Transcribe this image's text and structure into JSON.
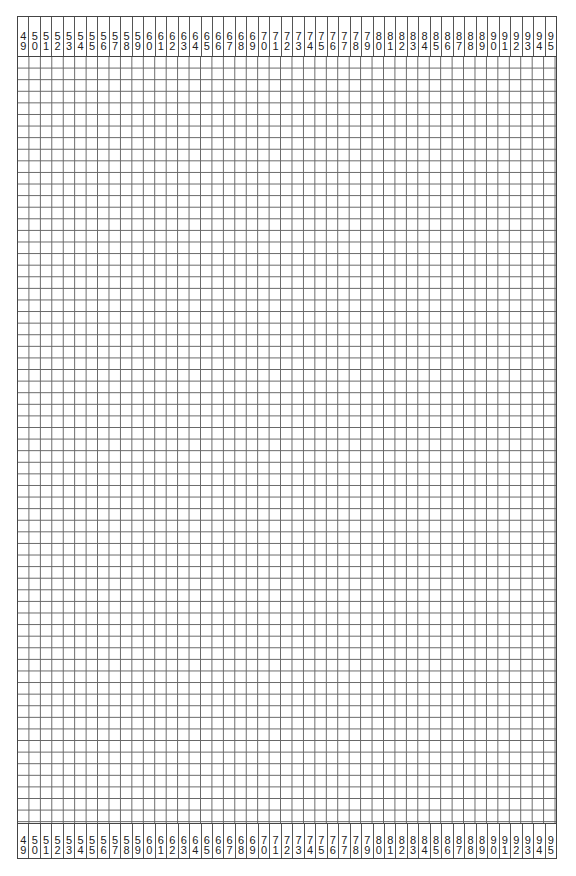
{
  "sheet": {
    "column_start": 49,
    "column_end": 95,
    "row_count": 66,
    "columns": [
      {
        "label": "49",
        "tens": "4",
        "ones": "9"
      },
      {
        "label": "50",
        "tens": "5",
        "ones": "0"
      },
      {
        "label": "51",
        "tens": "5",
        "ones": "1"
      },
      {
        "label": "52",
        "tens": "5",
        "ones": "2"
      },
      {
        "label": "53",
        "tens": "5",
        "ones": "3"
      },
      {
        "label": "54",
        "tens": "5",
        "ones": "4"
      },
      {
        "label": "55",
        "tens": "5",
        "ones": "5"
      },
      {
        "label": "56",
        "tens": "5",
        "ones": "6"
      },
      {
        "label": "57",
        "tens": "5",
        "ones": "7"
      },
      {
        "label": "58",
        "tens": "5",
        "ones": "8"
      },
      {
        "label": "59",
        "tens": "5",
        "ones": "9"
      },
      {
        "label": "60",
        "tens": "6",
        "ones": "0"
      },
      {
        "label": "61",
        "tens": "6",
        "ones": "1"
      },
      {
        "label": "62",
        "tens": "6",
        "ones": "2"
      },
      {
        "label": "63",
        "tens": "6",
        "ones": "3"
      },
      {
        "label": "64",
        "tens": "6",
        "ones": "4"
      },
      {
        "label": "65",
        "tens": "6",
        "ones": "5"
      },
      {
        "label": "66",
        "tens": "6",
        "ones": "6"
      },
      {
        "label": "67",
        "tens": "6",
        "ones": "7"
      },
      {
        "label": "68",
        "tens": "6",
        "ones": "8"
      },
      {
        "label": "69",
        "tens": "6",
        "ones": "9"
      },
      {
        "label": "70",
        "tens": "7",
        "ones": "0"
      },
      {
        "label": "71",
        "tens": "7",
        "ones": "1"
      },
      {
        "label": "72",
        "tens": "7",
        "ones": "2"
      },
      {
        "label": "73",
        "tens": "7",
        "ones": "3"
      },
      {
        "label": "74",
        "tens": "7",
        "ones": "4"
      },
      {
        "label": "75",
        "tens": "7",
        "ones": "5"
      },
      {
        "label": "76",
        "tens": "7",
        "ones": "6"
      },
      {
        "label": "77",
        "tens": "7",
        "ones": "7"
      },
      {
        "label": "78",
        "tens": "7",
        "ones": "8"
      },
      {
        "label": "79",
        "tens": "7",
        "ones": "9"
      },
      {
        "label": "80",
        "tens": "8",
        "ones": "0"
      },
      {
        "label": "81",
        "tens": "8",
        "ones": "1"
      },
      {
        "label": "82",
        "tens": "8",
        "ones": "2"
      },
      {
        "label": "83",
        "tens": "8",
        "ones": "3"
      },
      {
        "label": "84",
        "tens": "8",
        "ones": "4"
      },
      {
        "label": "85",
        "tens": "8",
        "ones": "5"
      },
      {
        "label": "86",
        "tens": "8",
        "ones": "6"
      },
      {
        "label": "87",
        "tens": "8",
        "ones": "7"
      },
      {
        "label": "88",
        "tens": "8",
        "ones": "8"
      },
      {
        "label": "89",
        "tens": "8",
        "ones": "9"
      },
      {
        "label": "90",
        "tens": "9",
        "ones": "0"
      },
      {
        "label": "91",
        "tens": "9",
        "ones": "1"
      },
      {
        "label": "92",
        "tens": "9",
        "ones": "2"
      },
      {
        "label": "93",
        "tens": "9",
        "ones": "3"
      },
      {
        "label": "94",
        "tens": "9",
        "ones": "4"
      },
      {
        "label": "95",
        "tens": "9",
        "ones": "5"
      }
    ]
  },
  "colors": {
    "grid_line": "#666666",
    "border": "#444444",
    "text": "#222222",
    "background": "#ffffff"
  }
}
